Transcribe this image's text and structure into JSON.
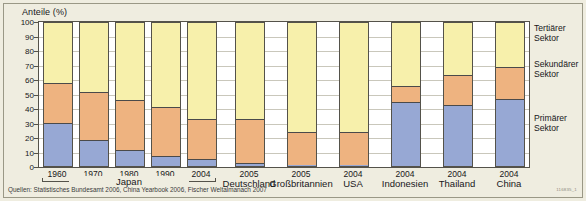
{
  "chart": {
    "axis_title": "Anteile (%)",
    "source": "Quellen: Statistisches Bundesamt 2006, China Yearbook 2006, Fischer Weltalmanach 2007",
    "id_code": "116835_1"
  },
  "legend": {
    "tertiary_line1": "Tertiärer",
    "tertiary_line2": "Sektor",
    "secondary_line1": "Sekundärer",
    "secondary_line2": "Sektor",
    "primary_line1": "Primärer",
    "primary_line2": "Sektor"
  },
  "yticks": [
    "100",
    "90",
    "80",
    "70",
    "60",
    "50",
    "40",
    "30",
    "20",
    "10",
    "0"
  ],
  "xlabels": [
    "1960",
    "1970",
    "1980",
    "1990",
    "2004",
    "2005",
    "2005",
    "2004",
    "2004",
    "2004",
    "2004"
  ],
  "groups": [
    {
      "label": "Japan",
      "from": 0,
      "to": 4
    },
    {
      "label": "Deutschland",
      "from": 5,
      "to": 5
    },
    {
      "label": "Großbritannien",
      "from": 6,
      "to": 6
    },
    {
      "label": "USA",
      "from": 7,
      "to": 7
    },
    {
      "label": "Indonesien",
      "from": 8,
      "to": 8
    },
    {
      "label": "Thailand",
      "from": 9,
      "to": 9
    },
    {
      "label": "China",
      "from": 10,
      "to": 10
    }
  ],
  "colors": {
    "primary": "#97a8d4",
    "secondary": "#eeb380",
    "tertiary": "#f7f0ab",
    "background": "#efede0",
    "plot_background": "#ffffff",
    "axis": "#54524a",
    "grid": "#c9c7bb"
  },
  "chart_data": {
    "type": "bar",
    "title": "Anteile (%)",
    "subtitle": "",
    "xlabel": "",
    "ylabel": "Anteile (%)",
    "ylim": [
      0,
      100
    ],
    "grid": true,
    "stacked": true,
    "legend_position": "right",
    "yticks": [
      0,
      10,
      20,
      30,
      40,
      50,
      60,
      70,
      80,
      90,
      100
    ],
    "categories": [
      "Japan 1960",
      "Japan 1970",
      "Japan 1980",
      "Japan 1990",
      "Japan 2004",
      "Deutschland 2005",
      "Großbritannien 2005",
      "USA 2004",
      "Indonesien 2004",
      "Thailand 2004",
      "China 2004"
    ],
    "countries": [
      "Japan",
      "Japan",
      "Japan",
      "Japan",
      "Japan",
      "Deutschland",
      "Großbritannien",
      "USA",
      "Indonesien",
      "Thailand",
      "China"
    ],
    "years": [
      "1960",
      "1970",
      "1980",
      "1990",
      "2004",
      "2005",
      "2005",
      "2004",
      "2004",
      "2004",
      "2004"
    ],
    "series": [
      {
        "name": "Primärer Sektor",
        "color": "#97a8d4",
        "values": [
          30,
          18,
          11,
          7,
          5,
          2,
          1,
          1,
          45,
          43,
          47
        ]
      },
      {
        "name": "Sekundärer Sektor",
        "color": "#eeb380",
        "values": [
          28,
          34,
          35,
          34,
          28,
          31,
          23,
          23,
          11,
          21,
          22
        ]
      },
      {
        "name": "Tertiärer Sektor",
        "color": "#f7f0ab",
        "values": [
          42,
          48,
          54,
          59,
          67,
          67,
          76,
          76,
          44,
          36,
          31
        ]
      }
    ],
    "annotations": [
      "Quellen: Statistisches Bundesamt 2006, China Yearbook 2006, Fischer Weltalmanach 2007"
    ]
  }
}
